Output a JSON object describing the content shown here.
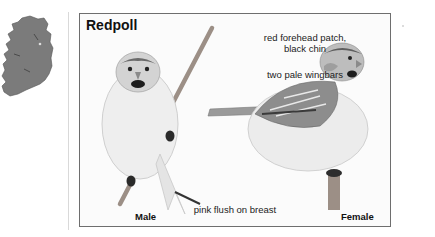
{
  "locator_map": {
    "region": "Ireland",
    "icon": "ireland-map-icon",
    "fill_color": "#7a7a7a"
  },
  "plate": {
    "title": "Redpoll",
    "annotations": {
      "forehead": "red forehead patch,",
      "chin": "black chin",
      "wingbars": "two pale wingbars",
      "breast": "pink flush on breast"
    },
    "labels": {
      "male": "Male",
      "female": "Female"
    },
    "border_color": "#6e6e6e"
  }
}
